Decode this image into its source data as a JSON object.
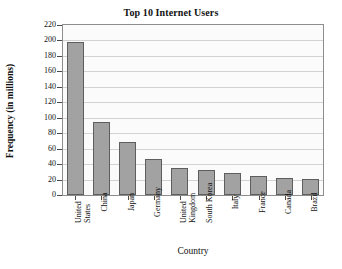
{
  "chart_data": {
    "type": "bar",
    "title": "Top 10 Internet Users",
    "xlabel": "Country",
    "ylabel": "Frequency (in millions)",
    "categories": [
      "United States",
      "China",
      "Japan",
      "Germany",
      "United Kingdom",
      "South Korea",
      "Italy",
      "France",
      "Canada",
      "Brazil"
    ],
    "values": [
      198,
      95,
      68,
      46,
      35,
      32,
      29,
      25,
      22,
      21
    ],
    "ylim": [
      0,
      220
    ],
    "ytick_step": 20,
    "yticks": [
      220,
      200,
      180,
      160,
      140,
      120,
      100,
      80,
      60,
      40,
      20,
      0
    ],
    "grid": true,
    "legend": null,
    "bar_color": "#a2a2a2",
    "bar_border_color": "#5e5e5e",
    "grid_color": "#d2d2d2",
    "axis_color": "#8d8d8d",
    "plot_background": "#fbfbfb"
  }
}
